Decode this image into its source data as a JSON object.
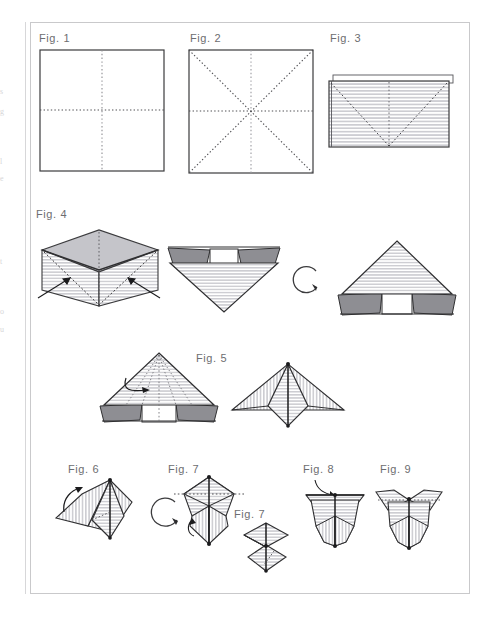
{
  "page": {
    "kind": "origami-instruction-diagram",
    "width": 482,
    "height": 619,
    "background_color": "#ffffff",
    "frame_border_color": "#c9c9cb",
    "ink_color": "#2b2b2b",
    "fold_line_color": "#6f6f74",
    "stripe_shade_color": "#c8c8cc",
    "flap_shade_color": "#8e8e93",
    "label_color": "#6d6d70"
  },
  "margin_bleed": {
    "visible": true,
    "description": "faint cut-off text fragments from facing page in left margin",
    "fragments": [
      "s",
      "g",
      "l",
      "e",
      "t",
      "o",
      "u"
    ]
  },
  "figures": [
    {
      "id": "fig1",
      "label": "Fig. 1",
      "step": 1,
      "shape": "square",
      "description": "Square sheet with horizontal and vertical dotted valley-fold crease lines through the center",
      "crease_lines": [
        "vertical-center",
        "horizontal-center"
      ],
      "shaded": false
    },
    {
      "id": "fig2",
      "label": "Fig. 2",
      "step": 2,
      "shape": "square",
      "description": "Square sheet with eight radiating dotted crease lines: vertical, horizontal and both diagonals",
      "crease_lines": [
        "vertical-center",
        "horizontal-center",
        "diagonal-tlbr",
        "diagonal-trbl"
      ],
      "shaded": false
    },
    {
      "id": "fig3",
      "label": "Fig. 3",
      "step": 3,
      "shape": "rectangle",
      "description": "Paper folded in half into a striped rectangle with dashed V valley folds and a vertical center crease",
      "crease_lines": [
        "vertical-center",
        "valley-v-left",
        "valley-v-right"
      ],
      "shaded": true,
      "stripe_direction": "horizontal"
    },
    {
      "id": "fig4",
      "label": "Fig. 4",
      "step": 4,
      "description": "Collapse the sides inward to form the preliminary base, then turn the model over",
      "stages": [
        {
          "id": "fig4-a",
          "shape": "open-box-3d",
          "description": "Three-dimensional open box view with shaded top face and two arrows pushing the sides inward",
          "arrows": [
            "push-in-left",
            "push-in-right"
          ]
        },
        {
          "id": "fig4-b",
          "shape": "inverted-triangle",
          "description": "Flattened inverted triangle with two dark folded flaps at the upper corners"
        },
        {
          "id": "fig4-rotate",
          "shape": "rotation-arrow",
          "description": "Circular clockwise turn-over arrow"
        },
        {
          "id": "fig4-c",
          "shape": "upright-triangle",
          "description": "Same model rotated so the triangle points up with dark flaps at the lower corners"
        }
      ]
    },
    {
      "id": "fig5",
      "label": "Fig. 5",
      "step": 5,
      "description": "Fold the front layers up along the radiating creases to form the bird base",
      "stages": [
        {
          "id": "fig5-a",
          "shape": "triangle-with-radiating-creases",
          "description": "Upright striped triangle with dotted creases radiating from the apex and a curved fold arrow",
          "arrows": [
            "fold-front-flap"
          ]
        },
        {
          "id": "fig5-b",
          "shape": "bird-base",
          "description": "Resulting kite/bird base with vertically striped wings and a horizontally striped central diamond"
        }
      ]
    },
    {
      "id": "fig6",
      "label": "Fig. 6",
      "step": 6,
      "shape": "angled-bird-base",
      "description": "Model tilted with a curved arrow folding the left wing over, followed by a turn-over rotation arrow",
      "arrows": [
        "fold-left-wing",
        "rotate-model"
      ]
    },
    {
      "id": "fig7",
      "label": "Fig. 7",
      "step": 7,
      "shape": "double-diamond",
      "description": "Upright double-diamond with a horizontal dotted crease across the top and a small curved arrow at the lower left",
      "crease_lines": [
        "horizontal-dotted-top"
      ],
      "arrows": [
        "fold-small-flap"
      ]
    },
    {
      "id": "fig7b",
      "label": "Fig. 7",
      "step": 7,
      "shape": "stacked-diamonds",
      "description": "Smaller detail view of two stacked diamonds with a dashed fold line",
      "crease_lines": [
        "diagonal-dashed"
      ]
    },
    {
      "id": "fig8",
      "label": "Fig. 8",
      "step": 8,
      "shape": "vase-form",
      "description": "Hourglass / vase shaped form with an arrow curving down into the open top",
      "arrows": [
        "insert-into-top"
      ]
    },
    {
      "id": "fig9",
      "label": "Fig. 9",
      "step": 9,
      "shape": "finished-form",
      "description": "Completed model with two triangular ear flaps opened out at the top",
      "crease_lines": [
        "ear-left-dotted",
        "ear-right-dotted"
      ]
    }
  ]
}
